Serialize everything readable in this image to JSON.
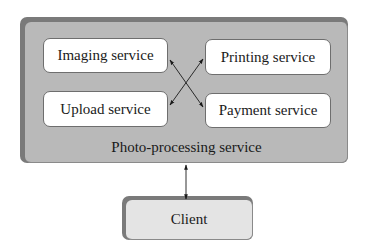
{
  "diagram": {
    "container": {
      "label": "Photo-processing service",
      "fill": "#b9b9b9",
      "edge": "#7a7a7a"
    },
    "services": [
      {
        "id": "imaging",
        "label": "Imaging service"
      },
      {
        "id": "upload",
        "label": "Upload service"
      },
      {
        "id": "printing",
        "label": "Printing service"
      },
      {
        "id": "payment",
        "label": "Payment service"
      }
    ],
    "client": {
      "label": "Client",
      "fill": "#e4e4e4"
    },
    "connections": [
      {
        "from": "imaging",
        "to": "payment",
        "type": "bidirectional"
      },
      {
        "from": "upload",
        "to": "printing",
        "type": "bidirectional"
      },
      {
        "from": "Photo-processing service",
        "to": "Client",
        "type": "bidirectional"
      }
    ]
  }
}
